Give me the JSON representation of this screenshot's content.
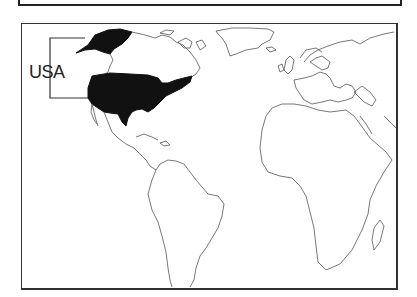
{
  "map": {
    "highlighted_region": "USA",
    "label": "USA",
    "colors": {
      "highlight_fill": "#111111",
      "outline": "#555555",
      "background": "#ffffff",
      "frame": "#333333"
    },
    "regions_shown": [
      "North America",
      "South America",
      "Greenland",
      "Europe",
      "Africa"
    ]
  }
}
